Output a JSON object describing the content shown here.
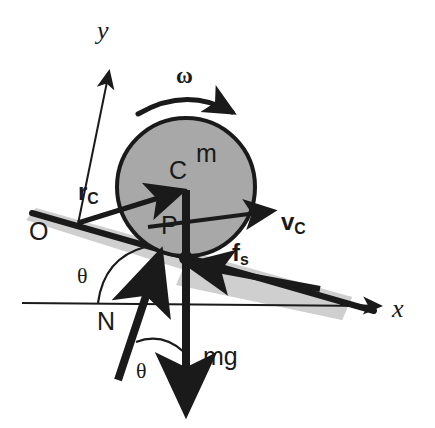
{
  "figure": {
    "type": "free-body-diagram",
    "background_color": "#ffffff",
    "ink_color": "#1a1a1a",
    "body_fill_color": "#a8a8a8",
    "incline_fill_color": "#cfcfcf"
  },
  "labels": {
    "y_axis": "y",
    "x_axis": "x",
    "origin": "O",
    "omega": "ω",
    "mass": "m",
    "center": "C",
    "contact_point": "P",
    "position_vector_main": "r",
    "position_vector_sub": "C",
    "velocity_main": "v",
    "velocity_sub": "C",
    "friction_main": "f",
    "friction_sub": "s",
    "normal_force": "N",
    "weight": "mg",
    "theta_incline": "θ",
    "theta_normal": "θ"
  },
  "geometry": {
    "ball": {
      "cx": 186,
      "cy": 187,
      "r": 69
    },
    "origin_point": {
      "x": 78,
      "y": 222
    },
    "contact_point": {
      "x": 186,
      "y": 256
    },
    "y_axis": {
      "x1": 78,
      "y1": 222,
      "x2": 108,
      "y2": 70
    },
    "x_axis": {
      "x1": 22,
      "y1": 303,
      "x2": 378,
      "y2": 306
    },
    "incline_line": {
      "x1": 32,
      "y1": 214,
      "x2": 372,
      "y2": 310
    },
    "incline_angle_degrees": 16,
    "vector_rc": {
      "x1": 78,
      "y1": 222,
      "x2": 182,
      "y2": 190
    },
    "vector_vc": {
      "x1": 150,
      "y1": 225,
      "x2": 272,
      "y2": 211
    },
    "vector_fs": {
      "x1": 318,
      "y1": 288,
      "x2": 190,
      "y2": 264
    },
    "vector_N": {
      "x1": 120,
      "y1": 375,
      "x2": 158,
      "y2": 258
    },
    "vector_mg": {
      "x1": 186,
      "y1": 190,
      "x2": 186,
      "y2": 410
    },
    "omega_arc": {
      "start_x": 139,
      "start_y": 112,
      "end_x": 237,
      "end_y": 118
    }
  },
  "label_positions": {
    "y_axis": {
      "x": 97,
      "y": 18
    },
    "x_axis": {
      "x": 392,
      "y": 298
    },
    "origin": {
      "x": 29,
      "y": 220
    },
    "omega": {
      "x": 176,
      "y": 64
    },
    "mass": {
      "x": 196,
      "y": 142
    },
    "center": {
      "x": 168,
      "y": 158
    },
    "contact_point": {
      "x": 163,
      "y": 214
    },
    "rc": {
      "x": 78,
      "y": 180
    },
    "vc": {
      "x": 280,
      "y": 211
    },
    "fs": {
      "x": 232,
      "y": 241
    },
    "normal_force": {
      "x": 98,
      "y": 310
    },
    "weight": {
      "x": 203,
      "y": 345
    },
    "theta_incline": {
      "x": 78,
      "y": 265
    },
    "theta_normal": {
      "x": 136,
      "y": 360
    }
  }
}
